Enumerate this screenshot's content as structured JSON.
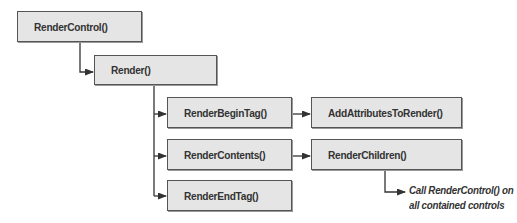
{
  "diagram": {
    "type": "call-hierarchy",
    "colors": {
      "box_fill": "#e5e5e5",
      "box_border": "#555555",
      "line": "#333333",
      "text": "#333333"
    },
    "nodes": {
      "render_control": {
        "label": "RenderControl()"
      },
      "render": {
        "label": "Render()"
      },
      "render_begin_tag": {
        "label": "RenderBeginTag()"
      },
      "render_contents": {
        "label": "RenderContents()"
      },
      "render_end_tag": {
        "label": "RenderEndTag()"
      },
      "add_attributes_to_render": {
        "label": "AddAttributesToRender()"
      },
      "render_children": {
        "label": "RenderChildren()"
      }
    },
    "note": {
      "line1": "Call RenderControl() on",
      "line2": "all contained controls"
    },
    "edges": [
      {
        "from": "RenderControl()",
        "to": "Render()"
      },
      {
        "from": "Render()",
        "to": "RenderBeginTag()"
      },
      {
        "from": "Render()",
        "to": "RenderContents()"
      },
      {
        "from": "Render()",
        "to": "RenderEndTag()"
      },
      {
        "from": "RenderBeginTag()",
        "to": "AddAttributesToRender()"
      },
      {
        "from": "RenderContents()",
        "to": "RenderChildren()"
      },
      {
        "from": "RenderChildren()",
        "to": "Call RenderControl() on all contained controls"
      }
    ]
  }
}
